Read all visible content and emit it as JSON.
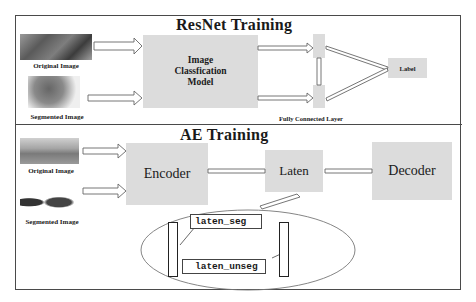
{
  "resnet": {
    "title": "ResNet Training",
    "original_caption": "Original Image",
    "segmented_caption": "Segmented Image",
    "model_label_line1": "Image",
    "model_label_line2": "Classfication",
    "model_label_line3": "Model",
    "fc_caption": "Fully Connected Layer",
    "output_label": "Label"
  },
  "ae": {
    "title": "AE Training",
    "original_caption": "Original Image",
    "segmented_caption": "Segmented Image",
    "encoder_label": "Encoder",
    "latent_label": "Laten",
    "decoder_label": "Decoder",
    "latent_seg_label": "laten_seg",
    "latent_unseg_label": "laten_unseg"
  },
  "colors": {
    "box_fill": "#dcdcdc",
    "border": "#4a4a4a",
    "arrow_stroke": "#666666"
  }
}
